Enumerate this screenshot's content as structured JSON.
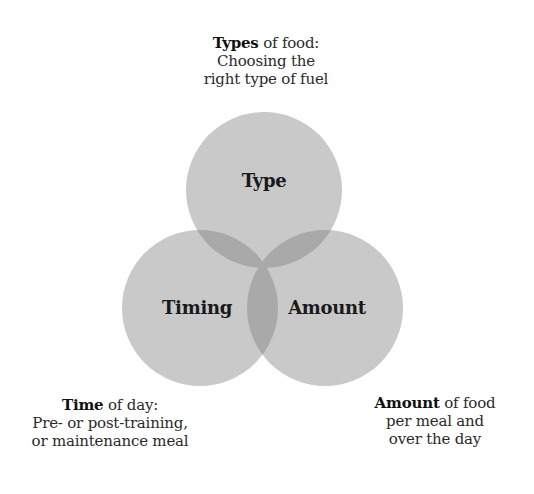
{
  "diagram": {
    "type": "venn",
    "colors": {
      "circle_fill": "#c9c9c9",
      "overlap_fill": "#a9a9a9",
      "background": "#ffffff",
      "text": "#1e1e1e"
    },
    "circles": [
      {
        "id": "type",
        "label": "Type",
        "cx": 264,
        "cy": 190,
        "r": 78
      },
      {
        "id": "timing",
        "label": "Timing",
        "cx": 200,
        "cy": 308,
        "r": 78
      },
      {
        "id": "amount",
        "label": "Amount",
        "cx": 325,
        "cy": 308,
        "r": 78
      }
    ],
    "captions": {
      "top": {
        "bold": "Types",
        "rest": " of food:",
        "line2": "Choosing the",
        "line3": "right type of fuel"
      },
      "left": {
        "bold": "Time",
        "rest": " of day:",
        "line2": "Pre- or post-training,",
        "line3": "or maintenance meal"
      },
      "right": {
        "bold": "Amount",
        "rest": " of food",
        "line2": "per meal and",
        "line3": "over the day"
      }
    }
  }
}
